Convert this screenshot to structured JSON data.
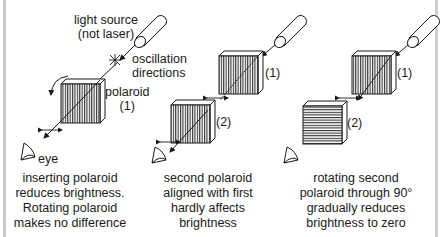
{
  "panels": [
    {
      "id": "panel-1",
      "labels": {
        "light_source_line1": "light source",
        "light_source_line2": "(not laser)",
        "oscillation_line1": "oscillation",
        "oscillation_line2": "directions",
        "polaroid_line1": "polaroid",
        "polaroid_line2": "(1)",
        "eye": "eye"
      },
      "caption": [
        "inserting polaroid",
        "reduces brightness.",
        "Rotating polaroid",
        "makes no difference"
      ],
      "filter_orientation": "vertical"
    },
    {
      "id": "panel-2",
      "labels": {
        "polaroid_1": "(1)",
        "polaroid_2": "(2)"
      },
      "caption": [
        "second polaroid",
        "aligned with first",
        "hardly affects",
        "brightness"
      ],
      "filter_orientations": [
        "vertical",
        "vertical"
      ]
    },
    {
      "id": "panel-3",
      "labels": {
        "polaroid_1": "(1)",
        "polaroid_2": "(2)"
      },
      "caption": [
        "rotating second",
        "polaroid through 90°",
        "gradually reduces",
        "brightness to zero"
      ],
      "filter_orientations": [
        "vertical",
        "horizontal"
      ]
    }
  ],
  "icons": [
    "light-source-icon",
    "oscillation-star-icon",
    "polaroid-filter-icon",
    "eye-icon",
    "rotation-arrow-icon",
    "double-arrow-icon"
  ],
  "colors": {
    "line": "#1a1a1a",
    "frame": "#c9c9c9",
    "background": "#ffffff"
  }
}
